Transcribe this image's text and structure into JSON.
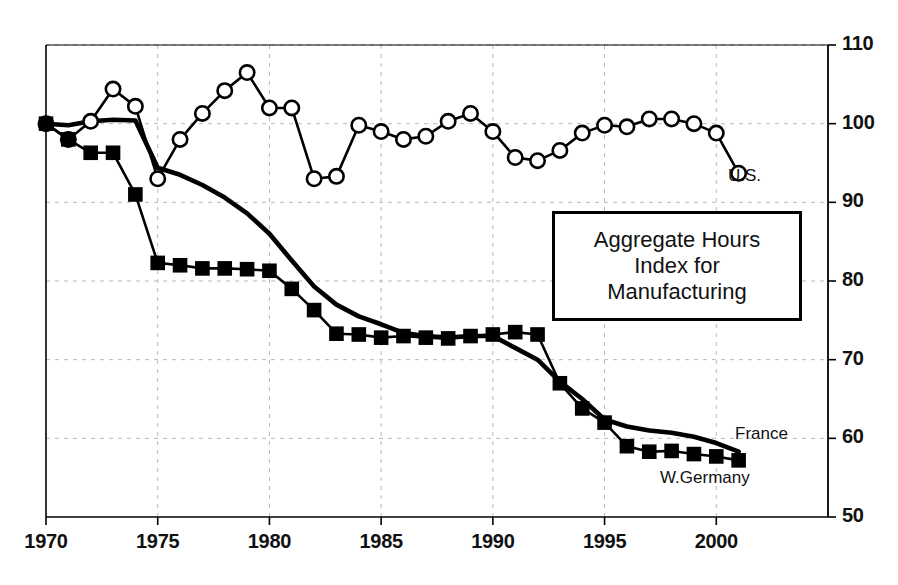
{
  "caption": {
    "line1": "Aggregate Hours",
    "line2": "Index for",
    "line3": "Manufacturing"
  },
  "labels": {
    "us": "U.S.",
    "france": "France",
    "west_germany": "W.Germany"
  },
  "colors": {
    "line": "#000000",
    "marker_fill_open": "#ffffff",
    "marker_fill_solid": "#000000",
    "grid": "#b8b8b8",
    "axis": "#000000",
    "text": "#111111"
  },
  "chart_data": {
    "type": "line",
    "title": "Aggregate Hours Index for Manufacturing",
    "xlabel": "",
    "ylabel": "",
    "xlim": [
      1970,
      2005
    ],
    "ylim": [
      50,
      110
    ],
    "xticks": [
      1970,
      1975,
      1980,
      1985,
      1990,
      1995,
      2000
    ],
    "yticks": [
      50,
      60,
      70,
      80,
      90,
      100,
      110
    ],
    "grid": true,
    "grid_style": "dashed",
    "legend": "inline-labels",
    "x": [
      1970,
      1971,
      1972,
      1973,
      1974,
      1975,
      1976,
      1977,
      1978,
      1979,
      1980,
      1981,
      1982,
      1983,
      1984,
      1985,
      1986,
      1987,
      1988,
      1989,
      1990,
      1991,
      1992,
      1993,
      1994,
      1995,
      1996,
      1997,
      1998,
      1999,
      2000,
      2001
    ],
    "series": [
      {
        "name": "U.S.",
        "marker": "open-circle",
        "values": [
          100.0,
          98.0,
          100.3,
          104.4,
          102.2,
          93.0,
          98.0,
          101.3,
          104.2,
          106.5,
          102.0,
          102.0,
          93.0,
          93.3,
          99.8,
          99.0,
          98.0,
          98.4,
          100.3,
          101.3,
          99.0,
          95.7,
          95.3,
          96.6,
          98.8,
          99.8,
          99.6,
          100.6,
          100.6,
          100.0,
          98.8,
          93.7
        ]
      },
      {
        "name": "France",
        "marker": "none",
        "values": [
          100.0,
          99.8,
          100.3,
          100.5,
          100.4,
          94.4,
          93.5,
          92.2,
          90.6,
          88.6,
          86.0,
          82.6,
          79.3,
          77.0,
          75.5,
          74.5,
          73.4,
          73.0,
          72.8,
          73.0,
          73.0,
          71.5,
          70.0,
          67.2,
          65.0,
          62.4,
          61.5,
          61.0,
          60.7,
          60.2,
          59.4,
          58.3
        ]
      },
      {
        "name": "W.Germany",
        "marker": "solid-square",
        "values": [
          100.0,
          98.0,
          96.3,
          96.3,
          91.0,
          82.3,
          82.0,
          81.6,
          81.6,
          81.5,
          81.3,
          79.0,
          76.3,
          73.3,
          73.2,
          72.8,
          73.0,
          72.8,
          72.7,
          73.0,
          73.2,
          73.5,
          73.2,
          67.0,
          63.8,
          62.0,
          59.0,
          58.3,
          58.4,
          58.0,
          57.7,
          57.2
        ]
      }
    ]
  }
}
